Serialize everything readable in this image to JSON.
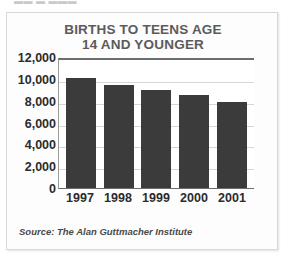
{
  "top_sliver_text": "▬▬ ▬  ▬▬▬",
  "figure": {
    "title_line1": "BIRTHS TO TEENS AGE",
    "title_line2": "14 AND YOUNGER",
    "source": "Source: The Alan Guttmacher Institute",
    "colors": {
      "bar": "#3b3b3b",
      "title": "#5b5b5b",
      "axis": "#6d6d6d",
      "gridline": "#d6d6d6",
      "panel_background": "#fdfdfd",
      "plot_background": "#ffffff"
    }
  },
  "chart_data": {
    "type": "bar",
    "title": "BIRTHS TO TEENS AGE 14 AND YOUNGER",
    "xlabel": "",
    "ylabel": "",
    "categories": [
      "1997",
      "1998",
      "1999",
      "2000",
      "2001"
    ],
    "values": [
      10100,
      9400,
      9000,
      8500,
      7900
    ],
    "ylim": [
      0,
      12000
    ],
    "yticks": [
      12000,
      10000,
      8000,
      6000,
      4000,
      2000,
      0
    ],
    "ytick_labels": [
      "12,000",
      "10,000",
      "8,000",
      "6,000",
      "4,000",
      "2,000",
      "0"
    ],
    "grid": true,
    "legend": false,
    "source": "Source: The Alan Guttmacher Institute"
  }
}
